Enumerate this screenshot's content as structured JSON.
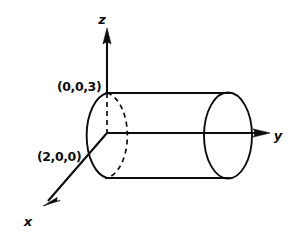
{
  "figure": {
    "kind": "3d-coordinate-diagram",
    "background_color": "#ffffff",
    "ink_color": "#0d0d0d",
    "axes": [
      {
        "id": "z",
        "label": "z",
        "direction": "up",
        "label_x": 105,
        "label_y": 22,
        "line": {
          "x1": 107,
          "y1": 30,
          "x2": 107,
          "y2": 93
        },
        "arrow": {
          "tip_x": 107,
          "tip_y": 28,
          "angle_deg": -90
        }
      },
      {
        "id": "y",
        "label": "y",
        "direction": "right",
        "label_x": 278,
        "label_y": 140,
        "line": {
          "x1": 107,
          "y1": 133,
          "x2": 268,
          "y2": 133
        },
        "arrow": {
          "tip_x": 270,
          "tip_y": 133,
          "angle_deg": 0
        }
      },
      {
        "id": "x",
        "label": "x",
        "direction": "down-left",
        "label_x": 26,
        "label_y": 224,
        "line": {
          "x1": 107,
          "y1": 133,
          "x2": 45,
          "y2": 204
        },
        "arrow": {
          "tip_x": 43,
          "tip_y": 206,
          "angle_deg": 131
        }
      }
    ],
    "point_labels": [
      {
        "id": "top-point",
        "text": "(0,0,3)",
        "x": 56,
        "y": 91,
        "describes": "top of cylinder on z-axis"
      },
      {
        "id": "front-point",
        "text": "(2,0,0)",
        "x": 36,
        "y": 161,
        "describes": "front of cylinder on x-axis"
      }
    ],
    "solid": {
      "cylinder_top_edge": {
        "x1": 107,
        "y1": 93,
        "x2": 228,
        "y2": 93
      },
      "cylinder_bottom_edge": {
        "x1": 107,
        "y1": 178,
        "x2": 228,
        "y2": 178
      },
      "right_cap_ellipse": {
        "cx": 228,
        "cy": 135.5,
        "rx": 24,
        "ry": 43
      },
      "left_cap_front_arc": "M 107 93 A 24 43 0 0 0 107 178"
    },
    "hidden": {
      "left_cap_back_arc": "M 107 93 A 24 43 0 0 1 107 178",
      "z_axis_interior": {
        "x1": 107,
        "y1": 93,
        "x2": 107,
        "y2": 133
      },
      "y_axis_interior": {
        "x1": 107,
        "y1": 133,
        "x2": 228,
        "y2": 133
      }
    }
  }
}
